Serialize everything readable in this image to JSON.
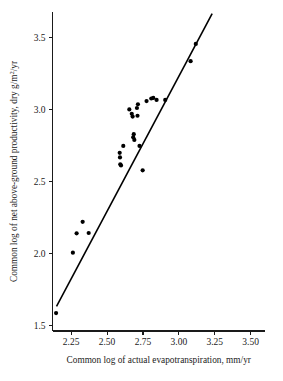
{
  "chart_data": {
    "type": "scatter",
    "title": "",
    "subtitle": "",
    "xlabel": "Common log of actual evapotranspiration, mm/yr",
    "ylabel_parts": {
      "before": "Common log of net above-ground productivity, dry g/m",
      "superscript": "2",
      "after": "/yr"
    },
    "ylabel": "Common log of net above-ground productivity, dry g/m2/yr",
    "xlim": [
      2.12,
      3.6
    ],
    "ylim": [
      1.46,
      3.68
    ],
    "xticks": [
      2.25,
      2.5,
      2.75,
      3.0,
      3.25,
      3.5
    ],
    "xtick_labels": [
      "2.25",
      "2.50",
      "2.75",
      "3.00",
      "3.25",
      "3.50"
    ],
    "yticks": [
      1.5,
      2.0,
      2.5,
      3.0,
      3.5
    ],
    "ytick_labels": [
      "1.5",
      "2.0",
      "2.5",
      "3.0",
      "3.5"
    ],
    "grid": false,
    "legend": false,
    "legend_position": "none",
    "marker": "filled-circle",
    "marker_color": "#000000",
    "marker_size_px": 3.1,
    "series": [
      {
        "name": "Sites",
        "points": [
          [
            2.145,
            1.585
          ],
          [
            2.262,
            2.005
          ],
          [
            2.288,
            2.14
          ],
          [
            2.33,
            2.22
          ],
          [
            2.372,
            2.142
          ],
          [
            2.588,
            2.7
          ],
          [
            2.59,
            2.668
          ],
          [
            2.592,
            2.62
          ],
          [
            2.597,
            2.612
          ],
          [
            2.613,
            2.748
          ],
          [
            2.655,
            3.002
          ],
          [
            2.672,
            2.972
          ],
          [
            2.678,
            2.952
          ],
          [
            2.682,
            2.808
          ],
          [
            2.686,
            2.83
          ],
          [
            2.69,
            2.79
          ],
          [
            2.708,
            3.012
          ],
          [
            2.712,
            2.958
          ],
          [
            2.715,
            3.038
          ],
          [
            2.726,
            2.748
          ],
          [
            2.748,
            2.578
          ],
          [
            2.775,
            3.06
          ],
          [
            2.808,
            3.078
          ],
          [
            2.822,
            3.082
          ],
          [
            2.845,
            3.068
          ],
          [
            2.905,
            3.068
          ],
          [
            3.082,
            3.338
          ],
          [
            3.118,
            3.458
          ]
        ]
      }
    ],
    "fit_line": {
      "name": "Least-squares regression line",
      "x0": 2.148,
      "y0": 1.632,
      "x1": 3.232,
      "y1": 3.668,
      "color": "#000000"
    }
  }
}
